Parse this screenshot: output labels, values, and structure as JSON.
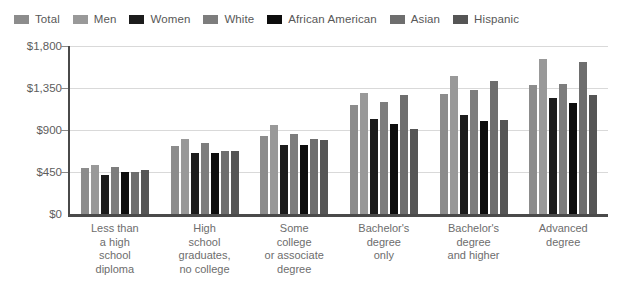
{
  "chart_data": {
    "type": "bar",
    "title": "",
    "xlabel": "",
    "ylabel": "",
    "ylim": [
      0,
      1800
    ],
    "grid": true,
    "legend_position": "top",
    "y_ticks": [
      "$0",
      "$450",
      "$900",
      "$1,350",
      "$1,800"
    ],
    "y_tick_values": [
      0,
      450,
      900,
      1350,
      1800
    ],
    "categories": [
      "Less than a high school diploma",
      "High school graduates, no college",
      "Some college or associate degree",
      "Bachelor's degree only",
      "Bachelor's degree and higher",
      "Advanced degree"
    ],
    "category_lines": [
      [
        "Less than",
        "a high",
        "school",
        "diploma"
      ],
      [
        "High",
        "school",
        "graduates,",
        "no college"
      ],
      [
        "Some",
        "college",
        "or associate",
        "degree"
      ],
      [
        "Bachelor's",
        "degree",
        "only"
      ],
      [
        "Bachelor's",
        "degree",
        "and higher"
      ],
      [
        "Advanced",
        "degree"
      ]
    ],
    "series": [
      {
        "name": "Total",
        "color": "#8c8c8c",
        "values": [
          493,
          730,
          833,
          1173,
          1281,
          1386
        ]
      },
      {
        "name": "Men",
        "color": "#999999",
        "values": [
          520,
          800,
          950,
          1300,
          1475,
          1660
        ]
      },
      {
        "name": "Women",
        "color": "#1c1c1c",
        "values": [
          420,
          655,
          740,
          1020,
          1060,
          1240
        ]
      },
      {
        "name": "White",
        "color": "#7d7d7d",
        "values": [
          500,
          760,
          855,
          1205,
          1325,
          1390
        ]
      },
      {
        "name": "African American",
        "color": "#0d0d0d",
        "values": [
          455,
          655,
          740,
          960,
          1000,
          1190
        ]
      },
      {
        "name": "Asian",
        "color": "#6e6e6e",
        "values": [
          445,
          680,
          800,
          1280,
          1425,
          1625
        ]
      },
      {
        "name": "Hispanic",
        "color": "#555555",
        "values": [
          470,
          680,
          790,
          915,
          1010,
          1270
        ]
      }
    ]
  },
  "legend": {
    "items": [
      {
        "label": "Total",
        "swatch": "#8c8c8c"
      },
      {
        "label": "Men",
        "swatch": "#999999"
      },
      {
        "label": "Women",
        "swatch": "#1c1c1c"
      },
      {
        "label": "White",
        "swatch": "#7d7d7d"
      },
      {
        "label": "African American",
        "swatch": "#0d0d0d"
      },
      {
        "label": "Asian",
        "swatch": "#6e6e6e"
      },
      {
        "label": "Hispanic",
        "swatch": "#555555"
      }
    ]
  }
}
